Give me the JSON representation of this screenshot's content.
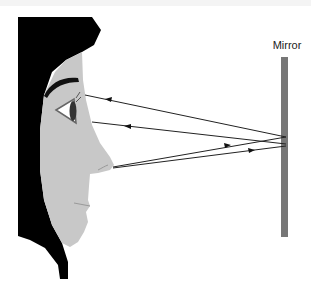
{
  "figure": {
    "mirror_label": "Mirror",
    "colors": {
      "hair": "#000000",
      "skin": "#c8c8c8",
      "mirror": "#777777",
      "rays": "#222222",
      "background": "#ffffff"
    },
    "rays": [
      {
        "from": "mirror",
        "to": "eye (upper)",
        "direction": "toward face"
      },
      {
        "from": "mirror",
        "to": "eye (lower)",
        "direction": "toward face"
      },
      {
        "from": "nose",
        "to": "mirror (upper)",
        "direction": "toward mirror"
      },
      {
        "from": "nose",
        "to": "mirror (lower)",
        "direction": "toward mirror"
      }
    ]
  }
}
